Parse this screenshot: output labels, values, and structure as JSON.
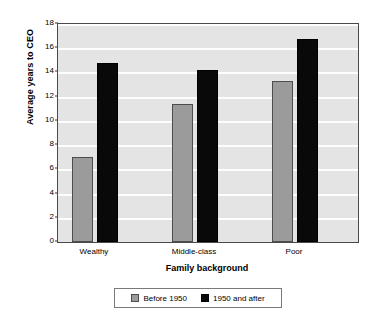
{
  "chart_data": {
    "type": "bar",
    "title": "",
    "xlabel": "Family background",
    "ylabel": "Average years to CEO",
    "categories": [
      "Wealthy",
      "Middle-class",
      "Poor"
    ],
    "series": [
      {
        "name": "Before 1950",
        "color": "#9b9b9b",
        "values": [
          7.0,
          11.4,
          13.3
        ]
      },
      {
        "name": "1950 and after",
        "color": "#090909",
        "values": [
          14.8,
          14.2,
          16.8
        ]
      }
    ],
    "ylim": [
      0,
      18
    ],
    "ytick_labels": [
      "0",
      "2",
      "4",
      "6",
      "8",
      "10",
      "12",
      "14",
      "16",
      "18"
    ],
    "ytick_values": [
      0,
      2,
      4,
      6,
      8,
      10,
      12,
      14,
      16,
      18
    ],
    "grid": "horizontal",
    "legend_position": "bottom",
    "plot_background": "#e4e4e4",
    "gridline_color": "#fdfdfd",
    "figure_background": "#ffffff"
  },
  "legend": {
    "entries": [
      {
        "label": "Before 1950",
        "swatch": "before-1950-swatch"
      },
      {
        "label": "1950 and after",
        "swatch": "1950-and-after-swatch"
      }
    ]
  }
}
